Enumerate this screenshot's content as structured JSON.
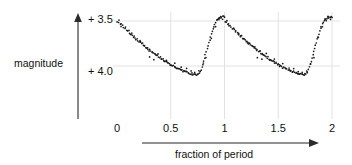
{
  "chart_data": {
    "type": "scatter",
    "title": "",
    "xlabel": "fraction of period",
    "ylabel": "magnitude",
    "xlim": [
      -0.05,
      2.05
    ],
    "ylim": [
      4.15,
      3.4
    ],
    "y_inverted": true,
    "grid": true,
    "legend": null,
    "x_ticks": [
      "0",
      "0.5",
      "1",
      "1.5",
      "2"
    ],
    "x_tick_values": [
      0,
      0.5,
      1,
      1.5,
      2
    ],
    "y_ticks": [
      "+ 3.5",
      "+ 4.0"
    ],
    "y_tick_values": [
      3.5,
      4.0
    ],
    "point_color": "#1a1a1a",
    "grid_color": "#e2e2e2",
    "axis_color": "#4a4a4a",
    "points": [
      [
        0.005,
        3.505
      ],
      [
        0.012,
        3.52
      ],
      [
        0.02,
        3.497
      ],
      [
        0.03,
        3.54
      ],
      [
        0.04,
        3.556
      ],
      [
        0.052,
        3.545
      ],
      [
        0.062,
        3.572
      ],
      [
        0.072,
        3.585
      ],
      [
        0.082,
        3.575
      ],
      [
        0.09,
        3.6
      ],
      [
        0.1,
        3.615
      ],
      [
        0.108,
        3.605
      ],
      [
        0.118,
        3.63
      ],
      [
        0.127,
        3.645
      ],
      [
        0.136,
        3.638
      ],
      [
        0.145,
        3.662
      ],
      [
        0.152,
        3.675
      ],
      [
        0.161,
        3.668
      ],
      [
        0.17,
        3.69
      ],
      [
        0.178,
        3.702
      ],
      [
        0.186,
        3.697
      ],
      [
        0.195,
        3.715
      ],
      [
        0.203,
        3.728
      ],
      [
        0.211,
        3.722
      ],
      [
        0.219,
        3.742
      ],
      [
        0.227,
        3.755
      ],
      [
        0.235,
        3.748
      ],
      [
        0.243,
        3.765
      ],
      [
        0.251,
        3.778
      ],
      [
        0.259,
        3.772
      ],
      [
        0.267,
        3.79
      ],
      [
        0.275,
        3.8
      ],
      [
        0.283,
        3.795
      ],
      [
        0.291,
        3.812
      ],
      [
        0.299,
        3.824
      ],
      [
        0.307,
        3.818
      ],
      [
        0.315,
        3.835
      ],
      [
        0.323,
        3.845
      ],
      [
        0.331,
        3.84
      ],
      [
        0.339,
        3.857
      ],
      [
        0.347,
        3.868
      ],
      [
        0.355,
        3.862
      ],
      [
        0.363,
        3.878
      ],
      [
        0.371,
        3.888
      ],
      [
        0.379,
        3.883
      ],
      [
        0.387,
        3.898
      ],
      [
        0.395,
        3.908
      ],
      [
        0.403,
        3.902
      ],
      [
        0.411,
        3.918
      ],
      [
        0.419,
        3.93
      ],
      [
        0.427,
        3.925
      ],
      [
        0.436,
        3.94
      ],
      [
        0.444,
        3.95
      ],
      [
        0.452,
        3.945
      ],
      [
        0.46,
        3.958
      ],
      [
        0.468,
        3.968
      ],
      [
        0.476,
        3.963
      ],
      [
        0.484,
        3.976
      ],
      [
        0.492,
        3.985
      ],
      [
        0.5,
        3.98
      ],
      [
        0.508,
        3.993
      ],
      [
        0.516,
        4.002
      ],
      [
        0.524,
        3.997
      ],
      [
        0.533,
        4.008
      ],
      [
        0.541,
        4.017
      ],
      [
        0.549,
        4.012
      ],
      [
        0.557,
        4.023
      ],
      [
        0.565,
        4.031
      ],
      [
        0.573,
        4.027
      ],
      [
        0.581,
        4.037
      ],
      [
        0.59,
        4.045
      ],
      [
        0.598,
        4.041
      ],
      [
        0.606,
        4.05
      ],
      [
        0.614,
        4.057
      ],
      [
        0.622,
        4.053
      ],
      [
        0.63,
        4.062
      ],
      [
        0.638,
        4.068
      ],
      [
        0.646,
        4.064
      ],
      [
        0.654,
        4.072
      ],
      [
        0.662,
        4.078
      ],
      [
        0.67,
        4.075
      ],
      [
        0.678,
        4.082
      ],
      [
        0.686,
        4.088
      ],
      [
        0.694,
        4.085
      ],
      [
        0.702,
        4.09
      ],
      [
        0.71,
        4.094
      ],
      [
        0.718,
        4.092
      ],
      [
        0.726,
        4.096
      ],
      [
        0.734,
        4.098
      ],
      [
        0.742,
        4.095
      ],
      [
        0.75,
        4.092
      ],
      [
        0.758,
        4.085
      ],
      [
        0.766,
        4.075
      ],
      [
        0.774,
        4.06
      ],
      [
        0.782,
        4.04
      ],
      [
        0.79,
        4.015
      ],
      [
        0.798,
        3.985
      ],
      [
        0.806,
        3.95
      ],
      [
        0.814,
        3.915
      ],
      [
        0.822,
        3.88
      ],
      [
        0.83,
        3.845
      ],
      [
        0.838,
        3.81
      ],
      [
        0.846,
        3.775
      ],
      [
        0.854,
        3.74
      ],
      [
        0.862,
        3.705
      ],
      [
        0.87,
        3.672
      ],
      [
        0.878,
        3.64
      ],
      [
        0.886,
        3.61
      ],
      [
        0.894,
        3.582
      ],
      [
        0.902,
        3.558
      ],
      [
        0.91,
        3.535
      ],
      [
        0.918,
        3.515
      ],
      [
        0.926,
        3.498
      ],
      [
        0.934,
        3.485
      ],
      [
        0.942,
        3.474
      ],
      [
        0.95,
        3.466
      ],
      [
        0.958,
        3.46
      ],
      [
        0.966,
        3.456
      ],
      [
        0.974,
        3.453
      ],
      [
        0.982,
        3.452
      ],
      [
        0.99,
        3.454
      ],
      [
        0.997,
        3.458
      ],
      [
        0.305,
        3.905
      ],
      [
        0.345,
        3.93
      ],
      [
        0.385,
        3.868
      ],
      [
        0.46,
        3.93
      ],
      [
        0.54,
        3.97
      ],
      [
        0.6,
        4.02
      ],
      [
        0.645,
        4.035
      ],
      [
        0.69,
        4.055
      ],
      [
        0.72,
        4.062
      ],
      [
        0.76,
        4.05
      ],
      [
        0.8,
        3.97
      ],
      [
        0.83,
        3.905
      ],
      [
        0.875,
        3.69
      ],
      [
        0.915,
        3.56
      ],
      [
        0.945,
        3.49
      ],
      [
        0.965,
        3.47
      ],
      [
        0.985,
        3.478
      ],
      [
        0.035,
        3.53
      ],
      [
        0.13,
        3.655
      ],
      [
        0.215,
        3.735
      ]
    ],
    "points_cycle2_offset": 1.0
  },
  "figure": {
    "x_axis_arrow_label": "fraction of period",
    "y_axis_arrow_label": "magnitude"
  }
}
